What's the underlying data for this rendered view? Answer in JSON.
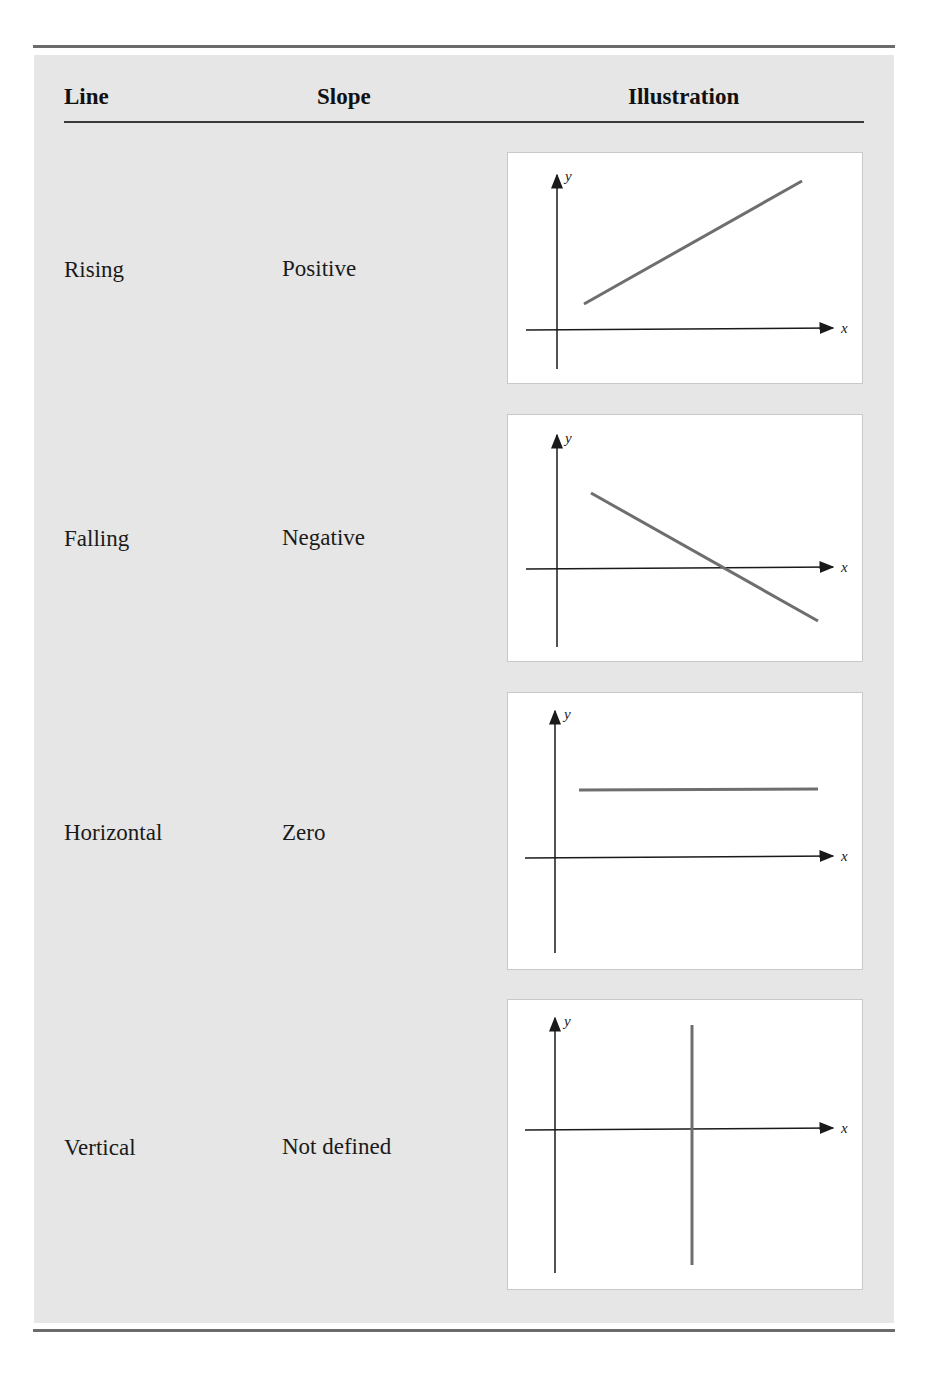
{
  "table": {
    "headers": {
      "line": "Line",
      "slope": "Slope",
      "illustration": "Illustration"
    },
    "rows": [
      {
        "line": "Rising",
        "slope": "Positive",
        "illustration": "rising-line-graph"
      },
      {
        "line": "Falling",
        "slope": "Negative",
        "illustration": "falling-line-graph"
      },
      {
        "line": "Horizontal",
        "slope": "Zero",
        "illustration": "horizontal-line-graph"
      },
      {
        "line": "Vertical",
        "slope": "Not defined",
        "illustration": "vertical-line-graph"
      }
    ]
  },
  "axes": {
    "x_label": "x",
    "y_label": "y"
  },
  "colors": {
    "panel_bg": "#e6e6e6",
    "figure_bg": "#ffffff",
    "plot_line": "#6e6e6e",
    "axis": "#1a1a1a",
    "rule": "#6b6b6b"
  }
}
